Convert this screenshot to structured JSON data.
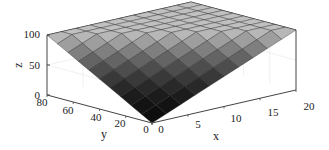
{
  "chart_data": {
    "type": "surface3d",
    "title": "",
    "xlabel": "x",
    "ylabel": "y",
    "zlabel": "z",
    "xlim": [
      0,
      20
    ],
    "ylim": [
      0,
      80
    ],
    "zlim": [
      0,
      100
    ],
    "xticks": [
      "0",
      "5",
      "10",
      "15",
      "20"
    ],
    "yticks": [
      "0",
      "20",
      "40",
      "60",
      "80"
    ],
    "zticks": [
      "0",
      "50",
      "100"
    ],
    "grid": true,
    "colormap": "gray",
    "x": [
      0,
      2,
      4,
      6,
      8,
      10,
      12,
      14,
      16,
      18,
      20
    ],
    "y": [
      0,
      8,
      16,
      24,
      32,
      40,
      48,
      56,
      64,
      72,
      80
    ],
    "z_description": "z = min(100, 5*x + 1.25*y) approx; plateau at 100 toward back (high x, high y), 0 at origin",
    "z": [
      [
        0,
        10,
        20,
        30,
        40,
        50,
        60,
        70,
        80,
        90,
        100
      ],
      [
        10,
        20,
        30,
        40,
        50,
        60,
        70,
        80,
        90,
        100,
        100
      ],
      [
        20,
        30,
        40,
        50,
        60,
        70,
        80,
        90,
        100,
        100,
        100
      ],
      [
        30,
        40,
        50,
        60,
        70,
        80,
        90,
        100,
        100,
        100,
        100
      ],
      [
        40,
        50,
        60,
        70,
        80,
        90,
        100,
        100,
        100,
        100,
        100
      ],
      [
        50,
        60,
        70,
        80,
        90,
        100,
        100,
        100,
        100,
        100,
        100
      ],
      [
        60,
        70,
        80,
        90,
        100,
        100,
        100,
        100,
        100,
        100,
        100
      ],
      [
        70,
        80,
        90,
        100,
        100,
        100,
        100,
        100,
        100,
        100,
        100
      ],
      [
        80,
        90,
        100,
        100,
        100,
        100,
        100,
        100,
        100,
        100,
        100
      ],
      [
        90,
        100,
        100,
        100,
        100,
        100,
        100,
        100,
        100,
        100,
        100
      ],
      [
        100,
        100,
        100,
        100,
        100,
        100,
        100,
        100,
        100,
        100,
        100
      ]
    ]
  },
  "labels": {
    "x": "x",
    "y": "y",
    "z": "z",
    "xticks": [
      "0",
      "5",
      "10",
      "15",
      "20"
    ],
    "yticks": [
      "0",
      "20",
      "40",
      "60",
      "80"
    ],
    "zticks": [
      "0",
      "50",
      "100"
    ]
  }
}
